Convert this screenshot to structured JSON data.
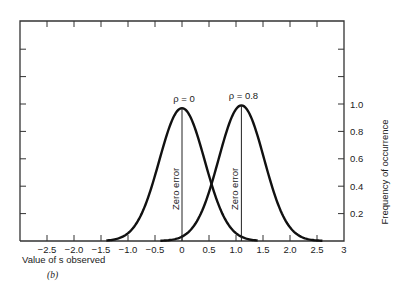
{
  "chart_data": {
    "type": "line",
    "title": "",
    "caption": "(b)",
    "xlabel": "Value of s observed",
    "ylabel": "Frequency of occurrence",
    "xlim": [
      -3.0,
      3.0
    ],
    "ylim": [
      0,
      1.4
    ],
    "x_ticks": [
      -2.5,
      -2.0,
      -1.5,
      -1.0,
      -0.5,
      0,
      0.5,
      1.0,
      1.5,
      2.0,
      2.5,
      3
    ],
    "x_tick_labels": [
      "−2.5",
      "−2.0",
      "−1.5",
      "−1.0",
      "−0.5",
      "0",
      "0.5",
      "1.0",
      "1.5",
      "2.0",
      "2.5",
      "3"
    ],
    "y_ticks": [
      0.2,
      0.4,
      0.6,
      0.8,
      1.0,
      1.2,
      1.4
    ],
    "y_tick_labels": [
      "0.2",
      "0.4",
      "0.6",
      "0.8",
      "1.0",
      "",
      ""
    ],
    "y_axis_position": "right",
    "grid": false,
    "series": [
      {
        "name": "ρ = 0",
        "label": "ρ = 0",
        "mean": 0.0,
        "peak": 0.97,
        "sigma": 0.42,
        "x": [
          -1.4,
          -1.0,
          -0.5,
          -0.25,
          0,
          0.25,
          0.5,
          1.0,
          1.4
        ],
        "values": [
          0.0,
          0.06,
          0.48,
          0.81,
          0.97,
          0.81,
          0.48,
          0.06,
          0.0
        ],
        "vertical_line_label": "Zero error"
      },
      {
        "name": "ρ = 0.8",
        "label": "ρ = 0.8",
        "mean": 1.1,
        "peak": 0.99,
        "sigma": 0.42,
        "x": [
          -0.4,
          0.1,
          0.6,
          0.85,
          1.1,
          1.35,
          1.6,
          2.1,
          2.6
        ],
        "values": [
          0.0,
          0.06,
          0.49,
          0.83,
          0.99,
          0.83,
          0.49,
          0.06,
          0.0
        ],
        "vertical_line_label": "Zero error"
      }
    ]
  }
}
